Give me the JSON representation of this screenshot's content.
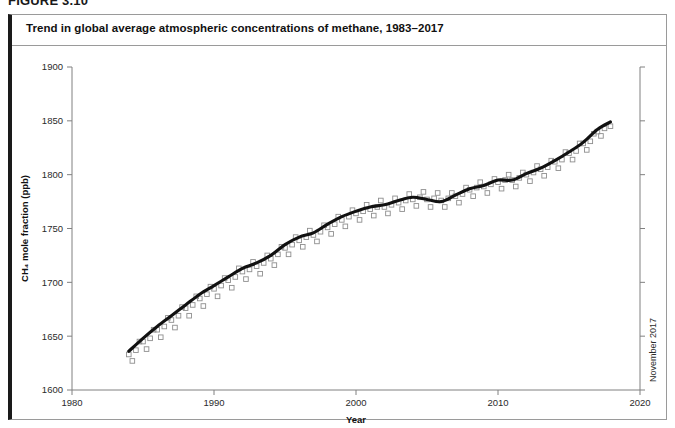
{
  "figure": {
    "number_label": "FIGURE 3.10",
    "title": "Trend in global average atmospheric concentrations of methane, 1983–2017"
  },
  "annotations": {
    "end_marker_label": "November 2017"
  },
  "chart_data": {
    "type": "line",
    "title": "Trend in global average atmospheric concentrations of methane, 1983–2017",
    "xlabel": "Year",
    "ylabel": "CH₄ mole fraction (ppb)",
    "xlim": [
      1980,
      2020
    ],
    "ylim": [
      1600,
      1900
    ],
    "xticks": [
      1980,
      1990,
      2000,
      2010,
      2020
    ],
    "xtick_labels": [
      "1980",
      "1990",
      "2000",
      "2010",
      "2020"
    ],
    "yticks": [
      1600,
      1650,
      1700,
      1750,
      1800,
      1850,
      1900
    ],
    "ytick_labels": [
      "1600",
      "1650",
      "1700",
      "1750",
      "1800",
      "1850",
      "1900"
    ],
    "grid": false,
    "legend": null,
    "series": [
      {
        "name": "Monthly mean CH4 mole fraction",
        "marker": "open-square",
        "color": "#8e8e8e",
        "x": [
          1984.0,
          1984.25,
          1984.5,
          1984.75,
          1985.0,
          1985.25,
          1985.5,
          1985.75,
          1986.0,
          1986.25,
          1986.5,
          1986.75,
          1987.0,
          1987.25,
          1987.5,
          1987.75,
          1988.0,
          1988.25,
          1988.5,
          1988.75,
          1989.0,
          1989.25,
          1989.5,
          1989.75,
          1990.0,
          1990.25,
          1990.5,
          1990.75,
          1991.0,
          1991.25,
          1991.5,
          1991.75,
          1992.0,
          1992.25,
          1992.5,
          1992.75,
          1993.0,
          1993.25,
          1993.5,
          1993.75,
          1994.0,
          1994.25,
          1994.5,
          1994.75,
          1995.0,
          1995.25,
          1995.5,
          1995.75,
          1996.0,
          1996.25,
          1996.5,
          1996.75,
          1997.0,
          1997.25,
          1997.5,
          1997.75,
          1998.0,
          1998.25,
          1998.5,
          1998.75,
          1999.0,
          1999.25,
          1999.5,
          1999.75,
          2000.0,
          2000.25,
          2000.5,
          2000.75,
          2001.0,
          2001.25,
          2001.5,
          2001.75,
          2002.0,
          2002.25,
          2002.5,
          2002.75,
          2003.0,
          2003.25,
          2003.5,
          2003.75,
          2004.0,
          2004.25,
          2004.5,
          2004.75,
          2005.0,
          2005.25,
          2005.5,
          2005.75,
          2006.0,
          2006.25,
          2006.5,
          2006.75,
          2007.0,
          2007.25,
          2007.5,
          2007.75,
          2008.0,
          2008.25,
          2008.5,
          2008.75,
          2009.0,
          2009.25,
          2009.5,
          2009.75,
          2010.0,
          2010.25,
          2010.5,
          2010.75,
          2011.0,
          2011.25,
          2011.5,
          2011.75,
          2012.0,
          2012.25,
          2012.5,
          2012.75,
          2013.0,
          2013.25,
          2013.5,
          2013.75,
          2014.0,
          2014.25,
          2014.5,
          2014.75,
          2015.0,
          2015.25,
          2015.5,
          2015.75,
          2016.0,
          2016.25,
          2016.5,
          2016.75,
          2017.0,
          2017.25,
          2017.5,
          2017.92
        ],
        "y": [
          1633,
          1627,
          1637,
          1645,
          1645,
          1638,
          1648,
          1656,
          1656,
          1649,
          1659,
          1667,
          1665,
          1658,
          1669,
          1677,
          1676,
          1669,
          1679,
          1687,
          1685,
          1678,
          1689,
          1696,
          1694,
          1687,
          1697,
          1704,
          1702,
          1695,
          1705,
          1713,
          1710,
          1703,
          1712,
          1719,
          1715,
          1708,
          1718,
          1725,
          1722,
          1716,
          1726,
          1733,
          1732,
          1726,
          1735,
          1742,
          1739,
          1733,
          1742,
          1748,
          1744,
          1738,
          1747,
          1753,
          1751,
          1745,
          1754,
          1761,
          1758,
          1752,
          1761,
          1767,
          1764,
          1758,
          1766,
          1772,
          1768,
          1762,
          1770,
          1776,
          1770,
          1764,
          1772,
          1778,
          1774,
          1768,
          1776,
          1782,
          1777,
          1771,
          1779,
          1784,
          1777,
          1770,
          1778,
          1783,
          1776,
          1770,
          1778,
          1783,
          1780,
          1774,
          1782,
          1788,
          1786,
          1780,
          1788,
          1793,
          1789,
          1783,
          1791,
          1796,
          1793,
          1787,
          1795,
          1800,
          1795,
          1789,
          1797,
          1802,
          1800,
          1794,
          1802,
          1808,
          1805,
          1799,
          1807,
          1813,
          1812,
          1806,
          1814,
          1821,
          1820,
          1814,
          1822,
          1829,
          1829,
          1823,
          1831,
          1838,
          1840,
          1836,
          1843,
          1845
        ]
      },
      {
        "name": "Smoothed trend",
        "color": "#111111",
        "x": [
          1984.0,
          1985.0,
          1986.0,
          1987.0,
          1988.0,
          1989.0,
          1990.0,
          1991.0,
          1992.0,
          1993.0,
          1994.0,
          1995.0,
          1996.0,
          1997.0,
          1998.0,
          1999.0,
          2000.0,
          2001.0,
          2002.0,
          2003.0,
          2004.0,
          2005.0,
          2006.0,
          2007.0,
          2008.0,
          2009.0,
          2010.0,
          2011.0,
          2012.0,
          2013.0,
          2014.0,
          2015.0,
          2016.0,
          2017.0,
          2017.92
        ],
        "y": [
          1636,
          1648,
          1659,
          1669,
          1679,
          1689,
          1697,
          1705,
          1713,
          1718,
          1725,
          1735,
          1742,
          1746,
          1754,
          1761,
          1766,
          1770,
          1772,
          1776,
          1779,
          1777,
          1775,
          1781,
          1787,
          1790,
          1795,
          1795,
          1801,
          1806,
          1813,
          1821,
          1830,
          1842,
          1849
        ]
      }
    ]
  }
}
